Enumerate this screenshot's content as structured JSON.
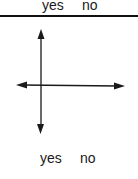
{
  "diagram": {
    "top_labels": {
      "yes": "yes",
      "no": "no"
    },
    "bottom_labels": {
      "yes": "yes",
      "no": "no"
    },
    "divider": {
      "color": "#111111"
    },
    "axes": {
      "color": "#1a1a1a",
      "vertical": {
        "x": 41,
        "y_top": 29,
        "y_bottom": 134,
        "arrow_up": true,
        "arrow_down": true
      },
      "horizontal": {
        "y": 85,
        "x_left": 16,
        "x_right": 125,
        "arrow_left": true,
        "arrow_right": true
      }
    }
  }
}
